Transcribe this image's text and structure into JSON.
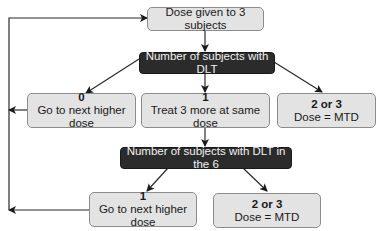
{
  "diagram": {
    "start": {
      "label": "Dose given to 3 subjects"
    },
    "decision1": {
      "label": "Number of subjects with DLT"
    },
    "outcomes1": [
      {
        "count": "0",
        "action": "Go to next higher dose"
      },
      {
        "count": "1",
        "action": "Treat 3 more at same dose"
      },
      {
        "count": "2 or 3",
        "action": "Dose = MTD"
      }
    ],
    "decision2": {
      "label": "Number of subjects with DLT in the 6"
    },
    "outcomes2": [
      {
        "count": "1",
        "action": "Go to next higher dose"
      },
      {
        "count": "2 or 3",
        "action": "Dose = MTD"
      }
    ]
  },
  "colors": {
    "light_box": "#e3e3e3",
    "dark_box": "#2b2b2b",
    "line": "#2a2a2a"
  }
}
